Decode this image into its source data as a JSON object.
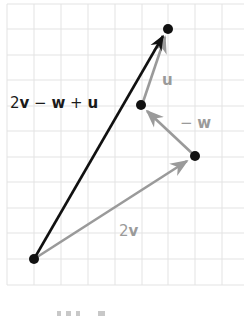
{
  "diagram": {
    "grid": {
      "cols": 8,
      "rows": 11,
      "color": "#e3e3e3"
    },
    "colors": {
      "result": "#111111",
      "component": "#9a9a9a",
      "point": "#111111"
    },
    "points": [
      {
        "name": "origin",
        "x": 0,
        "y": 0
      },
      {
        "name": "after-2v",
        "x": 6,
        "y": 4
      },
      {
        "name": "after-minus-w",
        "x": 4,
        "y": 6
      },
      {
        "name": "tip",
        "x": 5,
        "y": 9
      }
    ],
    "vectors": [
      {
        "name": "2v",
        "from": [
          0,
          0
        ],
        "to": [
          6,
          4
        ],
        "color": "gray"
      },
      {
        "name": "-w",
        "from": [
          6,
          4
        ],
        "to": [
          4,
          6
        ],
        "color": "gray"
      },
      {
        "name": "u",
        "from": [
          4,
          6
        ],
        "to": [
          5,
          9
        ],
        "color": "gray"
      },
      {
        "name": "2v - w + u",
        "from": [
          0,
          0
        ],
        "to": [
          5,
          9
        ],
        "color": "black"
      }
    ],
    "labels": {
      "result": {
        "coef": "2",
        "v": "v",
        "minus": " − ",
        "w": "w",
        "plus": " + ",
        "u": "u"
      },
      "two_v": {
        "coef": "2",
        "v": "v"
      },
      "minus_w": {
        "minus": "− ",
        "w": "w"
      },
      "u": "u"
    }
  }
}
